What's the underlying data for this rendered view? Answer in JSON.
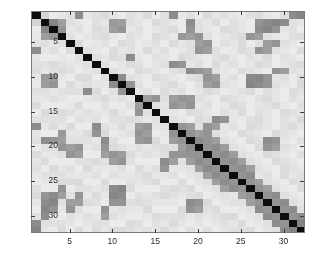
{
  "figure": {
    "type": "grayscale-matrix-heatmap",
    "background_color": "#ffffff",
    "axes_color": "#7a7a7a",
    "tick_color": "#2b2b2b"
  },
  "chart_data": {
    "type": "heatmap",
    "title": "",
    "xlabel": "",
    "ylabel": "",
    "colormap": "gray",
    "colormap_reversed": true,
    "grid": false,
    "legend": null,
    "n_rows": 32,
    "n_cols": 32,
    "symmetric": true,
    "xlim": [
      0.5,
      32.5
    ],
    "ylim": [
      0.5,
      32.5
    ],
    "x_tick_values": [
      5,
      10,
      15,
      20,
      25,
      30
    ],
    "y_tick_values": [
      5,
      10,
      15,
      20,
      25,
      30
    ],
    "x_tick_labels": [
      "5",
      "10",
      "15",
      "20",
      "25",
      "30"
    ],
    "y_tick_labels": [
      "5",
      "10",
      "15",
      "20",
      "25",
      "30"
    ],
    "value_range": [
      0.0,
      1.0
    ],
    "diagonal_value": 0.0,
    "note_diagonal": "dark (near-black) self-similarity diagonal",
    "matrix": [
      [
        0.05,
        0.83,
        0.92,
        0.9,
        0.88,
        0.55,
        0.9,
        0.88,
        0.86,
        0.9,
        0.92,
        0.88,
        0.9,
        0.86,
        0.92,
        0.88,
        0.55,
        0.9,
        0.88,
        0.92,
        0.86,
        0.9,
        0.88,
        0.9,
        0.92,
        0.88,
        0.86,
        0.9,
        0.92,
        0.88,
        0.55,
        0.52
      ],
      [
        0.83,
        0.05,
        0.52,
        0.62,
        0.88,
        0.9,
        0.92,
        0.88,
        0.9,
        0.6,
        0.62,
        0.88,
        0.9,
        0.92,
        0.86,
        0.88,
        0.9,
        0.92,
        0.55,
        0.88,
        0.9,
        0.86,
        0.92,
        0.88,
        0.9,
        0.92,
        0.58,
        0.55,
        0.52,
        0.55,
        0.88,
        0.9
      ],
      [
        0.92,
        0.52,
        0.05,
        0.58,
        0.9,
        0.88,
        0.92,
        0.86,
        0.88,
        0.62,
        0.58,
        0.9,
        0.88,
        0.92,
        0.9,
        0.88,
        0.86,
        0.92,
        0.58,
        0.88,
        0.9,
        0.92,
        0.86,
        0.88,
        0.9,
        0.92,
        0.55,
        0.52,
        0.58,
        0.9,
        0.88,
        0.92
      ],
      [
        0.9,
        0.62,
        0.58,
        0.05,
        0.88,
        0.92,
        0.9,
        0.88,
        0.86,
        0.9,
        0.92,
        0.88,
        0.9,
        0.92,
        0.86,
        0.88,
        0.9,
        0.6,
        0.62,
        0.58,
        0.88,
        0.92,
        0.9,
        0.88,
        0.86,
        0.58,
        0.62,
        0.88,
        0.9,
        0.92,
        0.88,
        0.86
      ],
      [
        0.88,
        0.88,
        0.9,
        0.88,
        0.05,
        0.86,
        0.92,
        0.9,
        0.88,
        0.92,
        0.86,
        0.88,
        0.92,
        0.9,
        0.88,
        0.92,
        0.86,
        0.9,
        0.88,
        0.62,
        0.58,
        0.92,
        0.88,
        0.9,
        0.86,
        0.92,
        0.88,
        0.62,
        0.58,
        0.88,
        0.9,
        0.92
      ],
      [
        0.55,
        0.9,
        0.88,
        0.92,
        0.86,
        0.05,
        0.88,
        0.9,
        0.92,
        0.86,
        0.9,
        0.88,
        0.92,
        0.86,
        0.9,
        0.88,
        0.92,
        0.9,
        0.88,
        0.58,
        0.62,
        0.88,
        0.92,
        0.9,
        0.86,
        0.88,
        0.58,
        0.62,
        0.88,
        0.9,
        0.92,
        0.86
      ],
      [
        0.9,
        0.92,
        0.92,
        0.9,
        0.92,
        0.88,
        0.05,
        0.88,
        0.9,
        0.86,
        0.88,
        0.55,
        0.9,
        0.92,
        0.88,
        0.9,
        0.92,
        0.86,
        0.88,
        0.9,
        0.92,
        0.88,
        0.86,
        0.9,
        0.92,
        0.88,
        0.9,
        0.86,
        0.92,
        0.88,
        0.9,
        0.92
      ],
      [
        0.88,
        0.88,
        0.86,
        0.88,
        0.9,
        0.9,
        0.88,
        0.05,
        0.88,
        0.92,
        0.9,
        0.86,
        0.88,
        0.92,
        0.9,
        0.88,
        0.55,
        0.58,
        0.9,
        0.88,
        0.92,
        0.86,
        0.9,
        0.88,
        0.92,
        0.9,
        0.86,
        0.88,
        0.92,
        0.9,
        0.88,
        0.86
      ],
      [
        0.86,
        0.9,
        0.88,
        0.86,
        0.88,
        0.92,
        0.9,
        0.88,
        0.05,
        0.88,
        0.9,
        0.92,
        0.86,
        0.88,
        0.9,
        0.92,
        0.88,
        0.86,
        0.55,
        0.58,
        0.62,
        0.88,
        0.9,
        0.92,
        0.86,
        0.88,
        0.9,
        0.92,
        0.58,
        0.62,
        0.88,
        0.9
      ],
      [
        0.9,
        0.6,
        0.62,
        0.9,
        0.92,
        0.86,
        0.86,
        0.92,
        0.88,
        0.05,
        0.55,
        0.88,
        0.9,
        0.92,
        0.86,
        0.88,
        0.9,
        0.92,
        0.88,
        0.86,
        0.58,
        0.62,
        0.9,
        0.88,
        0.92,
        0.55,
        0.52,
        0.58,
        0.9,
        0.88,
        0.92,
        0.86
      ],
      [
        0.92,
        0.62,
        0.58,
        0.92,
        0.86,
        0.9,
        0.88,
        0.9,
        0.9,
        0.55,
        0.05,
        0.58,
        0.88,
        0.92,
        0.9,
        0.88,
        0.86,
        0.9,
        0.92,
        0.88,
        0.62,
        0.58,
        0.88,
        0.9,
        0.92,
        0.52,
        0.55,
        0.58,
        0.88,
        0.9,
        0.92,
        0.86
      ],
      [
        0.88,
        0.88,
        0.9,
        0.88,
        0.88,
        0.88,
        0.55,
        0.86,
        0.92,
        0.88,
        0.58,
        0.05,
        0.9,
        0.88,
        0.92,
        0.86,
        0.9,
        0.88,
        0.92,
        0.9,
        0.86,
        0.88,
        0.92,
        0.9,
        0.88,
        0.86,
        0.92,
        0.88,
        0.9,
        0.92,
        0.86,
        0.88
      ],
      [
        0.9,
        0.9,
        0.88,
        0.9,
        0.92,
        0.92,
        0.9,
        0.88,
        0.86,
        0.9,
        0.88,
        0.9,
        0.05,
        0.62,
        0.58,
        0.88,
        0.62,
        0.58,
        0.6,
        0.88,
        0.9,
        0.92,
        0.86,
        0.88,
        0.9,
        0.92,
        0.88,
        0.86,
        0.9,
        0.92,
        0.88,
        0.9
      ],
      [
        0.86,
        0.92,
        0.92,
        0.92,
        0.9,
        0.86,
        0.92,
        0.92,
        0.88,
        0.92,
        0.92,
        0.88,
        0.62,
        0.05,
        0.88,
        0.9,
        0.58,
        0.62,
        0.58,
        0.9,
        0.88,
        0.92,
        0.9,
        0.86,
        0.88,
        0.92,
        0.9,
        0.88,
        0.86,
        0.9,
        0.92,
        0.88
      ],
      [
        0.92,
        0.86,
        0.9,
        0.86,
        0.88,
        0.9,
        0.88,
        0.9,
        0.9,
        0.86,
        0.9,
        0.92,
        0.58,
        0.88,
        0.05,
        0.88,
        0.9,
        0.92,
        0.86,
        0.88,
        0.9,
        0.92,
        0.88,
        0.9,
        0.86,
        0.92,
        0.88,
        0.9,
        0.92,
        0.86,
        0.88,
        0.9
      ],
      [
        0.88,
        0.88,
        0.88,
        0.88,
        0.92,
        0.88,
        0.9,
        0.88,
        0.92,
        0.88,
        0.88,
        0.86,
        0.88,
        0.9,
        0.88,
        0.05,
        0.88,
        0.9,
        0.92,
        0.86,
        0.88,
        0.55,
        0.58,
        0.9,
        0.92,
        0.88,
        0.86,
        0.9,
        0.92,
        0.88,
        0.9,
        0.86
      ],
      [
        0.55,
        0.9,
        0.86,
        0.9,
        0.86,
        0.92,
        0.92,
        0.55,
        0.88,
        0.9,
        0.86,
        0.9,
        0.62,
        0.58,
        0.9,
        0.88,
        0.05,
        0.58,
        0.62,
        0.88,
        0.58,
        0.62,
        0.9,
        0.88,
        0.92,
        0.86,
        0.88,
        0.9,
        0.92,
        0.88,
        0.86,
        0.9
      ],
      [
        0.9,
        0.92,
        0.92,
        0.6,
        0.9,
        0.9,
        0.86,
        0.58,
        0.86,
        0.92,
        0.9,
        0.88,
        0.58,
        0.62,
        0.92,
        0.9,
        0.58,
        0.05,
        0.58,
        0.62,
        0.58,
        0.88,
        0.9,
        0.92,
        0.86,
        0.88,
        0.9,
        0.92,
        0.86,
        0.88,
        0.9,
        0.92
      ],
      [
        0.88,
        0.55,
        0.58,
        0.62,
        0.88,
        0.88,
        0.88,
        0.9,
        0.55,
        0.88,
        0.92,
        0.92,
        0.6,
        0.58,
        0.86,
        0.92,
        0.62,
        0.58,
        0.05,
        0.55,
        0.58,
        0.62,
        0.88,
        0.9,
        0.92,
        0.86,
        0.88,
        0.55,
        0.58,
        0.9,
        0.92,
        0.88
      ],
      [
        0.92,
        0.88,
        0.88,
        0.58,
        0.62,
        0.58,
        0.9,
        0.88,
        0.58,
        0.86,
        0.88,
        0.9,
        0.88,
        0.9,
        0.88,
        0.86,
        0.88,
        0.62,
        0.55,
        0.05,
        0.58,
        0.55,
        0.62,
        0.88,
        0.9,
        0.92,
        0.86,
        0.58,
        0.62,
        0.88,
        0.9,
        0.92
      ],
      [
        0.86,
        0.9,
        0.9,
        0.88,
        0.58,
        0.62,
        0.92,
        0.92,
        0.62,
        0.58,
        0.62,
        0.86,
        0.9,
        0.88,
        0.9,
        0.88,
        0.58,
        0.58,
        0.58,
        0.58,
        0.05,
        0.58,
        0.55,
        0.62,
        0.88,
        0.9,
        0.92,
        0.86,
        0.88,
        0.9,
        0.92,
        0.88
      ],
      [
        0.9,
        0.86,
        0.92,
        0.92,
        0.92,
        0.88,
        0.88,
        0.86,
        0.88,
        0.62,
        0.58,
        0.88,
        0.92,
        0.92,
        0.92,
        0.55,
        0.62,
        0.88,
        0.62,
        0.55,
        0.58,
        0.05,
        0.58,
        0.55,
        0.62,
        0.88,
        0.9,
        0.92,
        0.86,
        0.88,
        0.9,
        0.92
      ],
      [
        0.88,
        0.92,
        0.86,
        0.9,
        0.88,
        0.92,
        0.86,
        0.9,
        0.9,
        0.9,
        0.88,
        0.92,
        0.86,
        0.9,
        0.88,
        0.58,
        0.9,
        0.9,
        0.88,
        0.62,
        0.55,
        0.58,
        0.05,
        0.58,
        0.55,
        0.62,
        0.88,
        0.9,
        0.92,
        0.86,
        0.88,
        0.9
      ],
      [
        0.9,
        0.88,
        0.88,
        0.88,
        0.9,
        0.9,
        0.9,
        0.88,
        0.92,
        0.88,
        0.9,
        0.9,
        0.88,
        0.86,
        0.9,
        0.9,
        0.88,
        0.92,
        0.9,
        0.88,
        0.62,
        0.55,
        0.58,
        0.05,
        0.58,
        0.55,
        0.9,
        0.88,
        0.92,
        0.86,
        0.9,
        0.88
      ],
      [
        0.92,
        0.9,
        0.9,
        0.86,
        0.86,
        0.86,
        0.92,
        0.92,
        0.86,
        0.92,
        0.92,
        0.88,
        0.9,
        0.88,
        0.86,
        0.92,
        0.92,
        0.86,
        0.92,
        0.9,
        0.88,
        0.62,
        0.55,
        0.58,
        0.05,
        0.58,
        0.62,
        0.88,
        0.9,
        0.92,
        0.86,
        0.88
      ],
      [
        0.88,
        0.92,
        0.92,
        0.58,
        0.92,
        0.88,
        0.88,
        0.9,
        0.88,
        0.55,
        0.52,
        0.86,
        0.92,
        0.92,
        0.92,
        0.88,
        0.86,
        0.88,
        0.86,
        0.92,
        0.9,
        0.88,
        0.62,
        0.55,
        0.58,
        0.05,
        0.58,
        0.62,
        0.88,
        0.9,
        0.92,
        0.86
      ],
      [
        0.86,
        0.58,
        0.55,
        0.62,
        0.88,
        0.58,
        0.9,
        0.86,
        0.9,
        0.52,
        0.55,
        0.92,
        0.88,
        0.9,
        0.88,
        0.86,
        0.88,
        0.9,
        0.88,
        0.86,
        0.92,
        0.9,
        0.88,
        0.9,
        0.62,
        0.58,
        0.05,
        0.58,
        0.55,
        0.88,
        0.9,
        0.92
      ],
      [
        0.9,
        0.55,
        0.52,
        0.88,
        0.62,
        0.62,
        0.86,
        0.88,
        0.92,
        0.58,
        0.58,
        0.88,
        0.86,
        0.88,
        0.9,
        0.9,
        0.9,
        0.92,
        0.55,
        0.58,
        0.86,
        0.92,
        0.9,
        0.88,
        0.88,
        0.62,
        0.58,
        0.05,
        0.58,
        0.55,
        0.88,
        0.9
      ],
      [
        0.92,
        0.52,
        0.58,
        0.9,
        0.58,
        0.88,
        0.92,
        0.92,
        0.58,
        0.9,
        0.88,
        0.9,
        0.9,
        0.86,
        0.92,
        0.92,
        0.92,
        0.86,
        0.58,
        0.62,
        0.88,
        0.86,
        0.92,
        0.92,
        0.9,
        0.88,
        0.55,
        0.58,
        0.05,
        0.58,
        0.55,
        0.88
      ],
      [
        0.88,
        0.55,
        0.9,
        0.92,
        0.88,
        0.9,
        0.88,
        0.9,
        0.62,
        0.88,
        0.9,
        0.92,
        0.92,
        0.9,
        0.86,
        0.88,
        0.88,
        0.88,
        0.9,
        0.88,
        0.9,
        0.88,
        0.86,
        0.86,
        0.92,
        0.9,
        0.88,
        0.55,
        0.58,
        0.05,
        0.58,
        0.55
      ],
      [
        0.55,
        0.88,
        0.88,
        0.88,
        0.9,
        0.92,
        0.9,
        0.88,
        0.88,
        0.92,
        0.92,
        0.86,
        0.88,
        0.92,
        0.88,
        0.9,
        0.86,
        0.9,
        0.92,
        0.9,
        0.92,
        0.9,
        0.88,
        0.9,
        0.86,
        0.92,
        0.9,
        0.88,
        0.55,
        0.58,
        0.05,
        0.52
      ],
      [
        0.52,
        0.9,
        0.92,
        0.86,
        0.92,
        0.86,
        0.92,
        0.86,
        0.9,
        0.86,
        0.86,
        0.88,
        0.9,
        0.88,
        0.9,
        0.86,
        0.9,
        0.92,
        0.88,
        0.92,
        0.88,
        0.92,
        0.9,
        0.88,
        0.88,
        0.86,
        0.92,
        0.9,
        0.88,
        0.55,
        0.52,
        0.05
      ]
    ]
  }
}
